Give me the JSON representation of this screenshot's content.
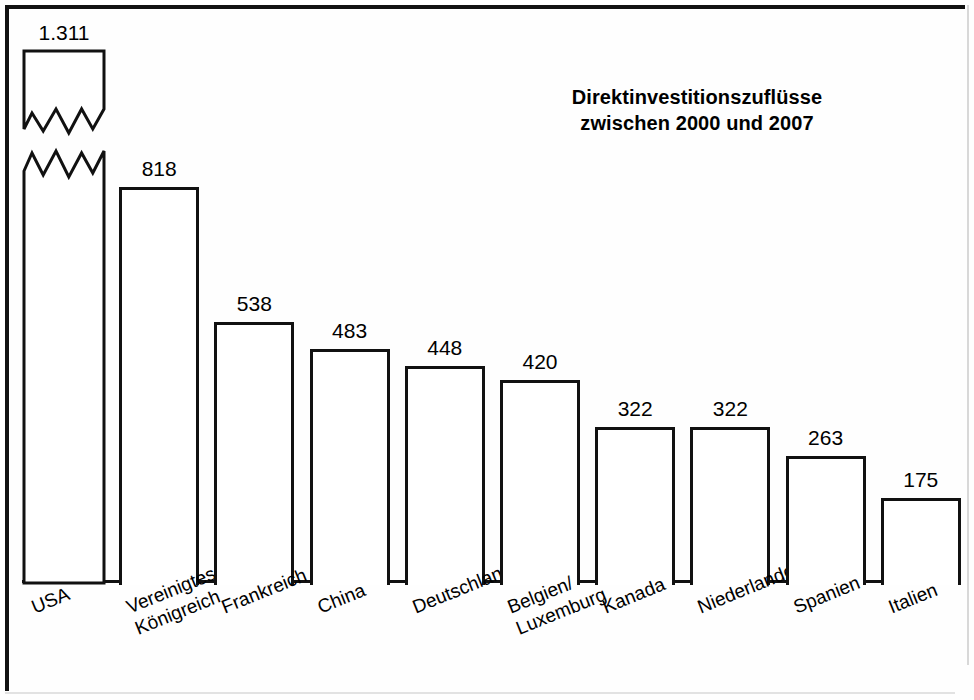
{
  "chart_data": {
    "type": "bar",
    "title": "Direktinvestitionszuflüsse zwischen 2000 und 2007",
    "title_line1": "Direktinvestitionszuflüsse",
    "title_line2": "zwischen 2000 und 2007",
    "xlabel": "",
    "ylabel": "",
    "grid": false,
    "legend": "none",
    "axis_break": {
      "present": true,
      "applies_to": "USA",
      "style": "double-zigzag",
      "note": "USA-Balken ist gebrochen dargestellt"
    },
    "ylim": [
      0,
      1311
    ],
    "categories": [
      "USA",
      "Vereinigtes Königreich",
      "Frankreich",
      "China",
      "Deutschland",
      "Belgien/ Luxemburg",
      "Kanada",
      "Niederlande",
      "Spanien",
      "Italien"
    ],
    "value_labels": [
      "1.311",
      "818",
      "538",
      "483",
      "448",
      "420",
      "322",
      "322",
      "263",
      "175"
    ],
    "values": [
      1311,
      818,
      538,
      483,
      448,
      420,
      322,
      322,
      263,
      175
    ],
    "bars": [
      {
        "category": "USA",
        "label_line1": "USA",
        "label_line2": "",
        "value": 1311,
        "value_label": "1.311",
        "broken": true
      },
      {
        "category": "Vereinigtes Königreich",
        "label_line1": "Vereinigtes",
        "label_line2": "Königreich",
        "value": 818,
        "value_label": "818",
        "broken": false
      },
      {
        "category": "Frankreich",
        "label_line1": "Frankreich",
        "label_line2": "",
        "value": 538,
        "value_label": "538",
        "broken": false
      },
      {
        "category": "China",
        "label_line1": "China",
        "label_line2": "",
        "value": 483,
        "value_label": "483",
        "broken": false
      },
      {
        "category": "Deutschland",
        "label_line1": "Deutschland",
        "label_line2": "",
        "value": 448,
        "value_label": "448",
        "broken": false
      },
      {
        "category": "Belgien/ Luxemburg",
        "label_line1": "Belgien/",
        "label_line2": "Luxemburg",
        "value": 420,
        "value_label": "420",
        "broken": false
      },
      {
        "category": "Kanada",
        "label_line1": "Kanada",
        "label_line2": "",
        "value": 322,
        "value_label": "322",
        "broken": false
      },
      {
        "category": "Niederlande",
        "label_line1": "Niederlande",
        "label_line2": "",
        "value": 322,
        "value_label": "322",
        "broken": false
      },
      {
        "category": "Spanien",
        "label_line1": "Spanien",
        "label_line2": "",
        "value": 263,
        "value_label": "263",
        "broken": false
      },
      {
        "category": "Italien",
        "label_line1": "Italien",
        "label_line2": "",
        "value": 175,
        "value_label": "175",
        "broken": false
      }
    ],
    "colors": {
      "bar_fill": "#ffffff",
      "bar_outline": "#111111",
      "background": "#fefefe",
      "text": "#000000"
    }
  }
}
